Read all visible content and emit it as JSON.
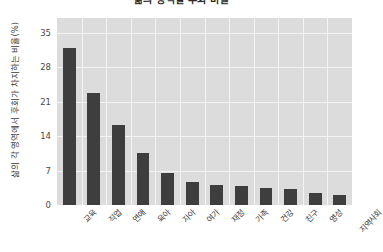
{
  "chart_data": {
    "type": "bar",
    "title": "삶의 영역별 후회 비율",
    "xlabel": "",
    "ylabel": "삶의 각 영역에서 후회가 차지하는 비율(%)",
    "categories": [
      "교육",
      "직업",
      "연애",
      "육아",
      "자아",
      "여가",
      "재정",
      "가족",
      "건강",
      "친구",
      "영성",
      "지역사회"
    ],
    "values": [
      32.0,
      22.8,
      16.3,
      10.6,
      6.5,
      4.7,
      4.1,
      3.9,
      3.5,
      3.2,
      2.5,
      2.0
    ],
    "ylim": [
      0,
      38
    ],
    "yticks": [
      0,
      7,
      14,
      21,
      28,
      35
    ],
    "ytick_labels": [
      "0",
      "7",
      "14",
      "21",
      "28",
      "35"
    ],
    "grid": true,
    "legend": false,
    "bar_color": "#3e3e3e",
    "plot_background": "#dcdcdc",
    "gridline_color": "#f4f4f4",
    "figure_background": "#ffffff"
  }
}
